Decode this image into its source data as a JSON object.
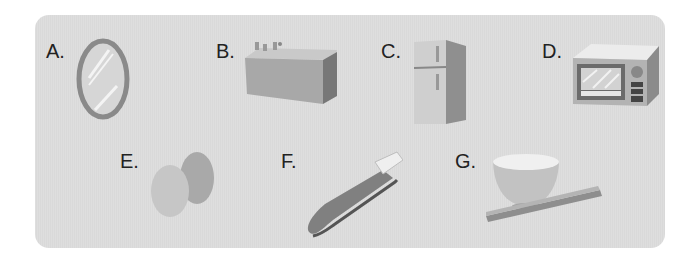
{
  "items": [
    {
      "letter": "A.",
      "object": "mirror"
    },
    {
      "letter": "B.",
      "object": "bathtub"
    },
    {
      "letter": "C.",
      "object": "refrigerator"
    },
    {
      "letter": "D.",
      "object": "microwave"
    },
    {
      "letter": "E.",
      "object": "eggs"
    },
    {
      "letter": "F.",
      "object": "toothbrush"
    },
    {
      "letter": "G.",
      "object": "bowl-and-chopsticks"
    }
  ]
}
